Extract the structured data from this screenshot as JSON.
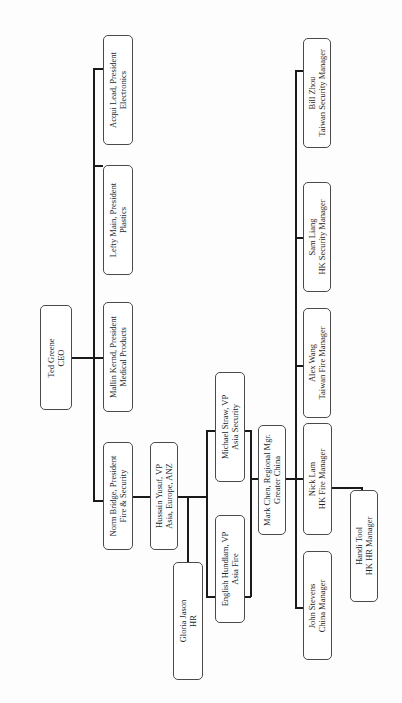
{
  "chart_title": "",
  "nodes": {
    "ceo": {
      "name": "Ted Greene",
      "title": "CEO"
    },
    "pres_fire": {
      "name": "Norm Bridge, President",
      "title": "Fire & Security"
    },
    "pres_medical": {
      "name": "Mallin Kernd, President",
      "title": "Medical Products"
    },
    "pres_plastics": {
      "name": "Lefty Main, President",
      "title": "Plastics"
    },
    "pres_electronics": {
      "name": "Acqui Lead, President",
      "title": "Electronics"
    },
    "vp_asia": {
      "name": "Hussain Yusuf, VP",
      "title": "Asia, Europe, ANZ"
    },
    "hr": {
      "name": "Gloria Jason",
      "title": "HR"
    },
    "vp_asia_fire": {
      "name": "English Hundlam, VP",
      "title": "Asia Fire"
    },
    "vp_asia_security": {
      "name": "Michael Straw, VP",
      "title": "Asia Security"
    },
    "regional_mgr": {
      "name": "Mark Chen, Regional Mgr.",
      "title": "Greater China"
    },
    "china_mgr": {
      "name": "John Stevens",
      "title": "China Manager"
    },
    "hk_fire_mgr": {
      "name": "Nick Lam",
      "title": "HK Fire Manager"
    },
    "hk_hr_mgr": {
      "name": "Handi Tool",
      "title": "HK HR Manager"
    },
    "tw_fire_mgr": {
      "name": "Alex Wang",
      "title": "Taiwan Fire Manager"
    },
    "hk_security_mgr": {
      "name": "Sam Liang",
      "title": "HK Security Manager"
    },
    "tw_security_mgr": {
      "name": "Bill Zhou",
      "title": "Taiwan Security Manager"
    }
  },
  "edges": [
    [
      "ceo",
      "pres_fire"
    ],
    [
      "ceo",
      "pres_medical"
    ],
    [
      "ceo",
      "pres_plastics"
    ],
    [
      "ceo",
      "pres_electronics"
    ],
    [
      "pres_fire",
      "vp_asia"
    ],
    [
      "vp_asia",
      "hr"
    ],
    [
      "vp_asia",
      "vp_asia_fire"
    ],
    [
      "vp_asia",
      "vp_asia_security"
    ],
    [
      "vp_asia_fire",
      "regional_mgr"
    ],
    [
      "vp_asia_security",
      "regional_mgr"
    ],
    [
      "regional_mgr",
      "china_mgr"
    ],
    [
      "regional_mgr",
      "hk_fire_mgr"
    ],
    [
      "regional_mgr",
      "tw_fire_mgr"
    ],
    [
      "regional_mgr",
      "hk_security_mgr"
    ],
    [
      "regional_mgr",
      "tw_security_mgr"
    ],
    [
      "hk_fire_mgr",
      "hk_hr_mgr"
    ]
  ],
  "colors": {
    "border": "#4a4a4a",
    "line": "#1a1a1a",
    "background": "#fdfdfd"
  }
}
